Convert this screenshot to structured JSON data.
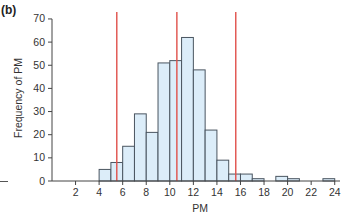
{
  "panel_label": "(b)",
  "colors": {
    "bar_fill": "#dcedf9",
    "bar_edge": "#4a5560",
    "axis": "#444444",
    "reference_line": "#e0504a"
  },
  "chart_data": {
    "type": "bar",
    "title": "",
    "panel": "(b)",
    "xlabel": "PM",
    "ylabel": "Frequency of PM",
    "xlim": [
      0,
      24.5
    ],
    "ylim": [
      0,
      70
    ],
    "x_ticks": [
      2,
      4,
      6,
      8,
      10,
      12,
      14,
      16,
      18,
      20,
      22,
      24
    ],
    "y_ticks": [
      0,
      10,
      20,
      30,
      40,
      50,
      60,
      70
    ],
    "grid": false,
    "legend": null,
    "bin_width": 1,
    "bins": [
      {
        "start": 4,
        "end": 5,
        "count": 5
      },
      {
        "start": 5,
        "end": 6,
        "count": 8
      },
      {
        "start": 6,
        "end": 7,
        "count": 15
      },
      {
        "start": 7,
        "end": 8,
        "count": 29
      },
      {
        "start": 8,
        "end": 9,
        "count": 21
      },
      {
        "start": 9,
        "end": 10,
        "count": 51
      },
      {
        "start": 10,
        "end": 11,
        "count": 52
      },
      {
        "start": 11,
        "end": 12,
        "count": 62
      },
      {
        "start": 12,
        "end": 13,
        "count": 48
      },
      {
        "start": 13,
        "end": 14,
        "count": 22
      },
      {
        "start": 14,
        "end": 15,
        "count": 9
      },
      {
        "start": 15,
        "end": 16,
        "count": 3
      },
      {
        "start": 16,
        "end": 17,
        "count": 3
      },
      {
        "start": 17,
        "end": 18,
        "count": 1
      },
      {
        "start": 18,
        "end": 19,
        "count": 0
      },
      {
        "start": 19,
        "end": 20,
        "count": 2
      },
      {
        "start": 20,
        "end": 21,
        "count": 1
      },
      {
        "start": 21,
        "end": 22,
        "count": 0
      },
      {
        "start": 22,
        "end": 23,
        "count": 0
      },
      {
        "start": 23,
        "end": 24,
        "count": 1
      }
    ],
    "reference_lines": [
      {
        "x": 5.5,
        "orientation": "vertical",
        "color": "#e0504a"
      },
      {
        "x": 10.6,
        "orientation": "vertical",
        "color": "#e0504a"
      },
      {
        "x": 15.6,
        "orientation": "vertical",
        "color": "#e0504a"
      }
    ]
  }
}
